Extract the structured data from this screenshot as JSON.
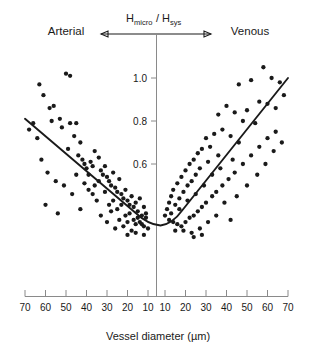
{
  "chart_data": {
    "type": "scatter",
    "title": "",
    "xlabel": "Vessel diameter (µm)",
    "ylabel": "Hmicro/Hsys",
    "ylabel_parts": {
      "h1": "H",
      "sub1": "micro",
      "slash": "/",
      "h2": "H",
      "sub2": "sys"
    },
    "side_labels": {
      "left": "Arterial",
      "right": "Venous"
    },
    "grid": false,
    "legend": "none",
    "xticks_left": [
      70,
      60,
      50,
      40,
      30,
      20,
      10
    ],
    "xticks_right": [
      10,
      20,
      30,
      40,
      50,
      60,
      70
    ],
    "xtick_labels_left": [
      "70",
      "60",
      "50",
      "40",
      "30",
      "20",
      "10"
    ],
    "xtick_labels_right": [
      "10",
      "20",
      "30",
      "40",
      "50",
      "60",
      "70"
    ],
    "yticks": [
      0.6,
      0.8,
      1.0
    ],
    "ytick_labels": [
      "0.6",
      "0.8",
      "1.0"
    ],
    "ylim": [
      0.25,
      1.08
    ],
    "axis_note": "x axis is mirrored: arterial diameters decrease left-to-right toward 10, venous diameters increase from 10 rightward",
    "series": [
      {
        "name": "Arterial vessels",
        "branch": "arterial",
        "marker": "filled-circle",
        "color": "#1a1a1a",
        "points": [
          {
            "d": 63,
            "r": 0.97
          },
          {
            "d": 61,
            "r": 0.92
          },
          {
            "d": 58,
            "r": 0.86
          },
          {
            "d": 56,
            "r": 0.87
          },
          {
            "d": 50,
            "r": 1.02
          },
          {
            "d": 48,
            "r": 1.01
          },
          {
            "d": 57,
            "r": 0.8
          },
          {
            "d": 53,
            "r": 0.81
          },
          {
            "d": 52,
            "r": 0.77
          },
          {
            "d": 48,
            "r": 0.79
          },
          {
            "d": 45,
            "r": 0.79
          },
          {
            "d": 46,
            "r": 0.73
          },
          {
            "d": 43,
            "r": 0.7
          },
          {
            "d": 49,
            "r": 0.67
          },
          {
            "d": 44,
            "r": 0.64
          },
          {
            "d": 42,
            "r": 0.62
          },
          {
            "d": 41,
            "r": 0.6
          },
          {
            "d": 40,
            "r": 0.58
          },
          {
            "d": 38,
            "r": 0.61
          },
          {
            "d": 37,
            "r": 0.59
          },
          {
            "d": 36,
            "r": 0.66
          },
          {
            "d": 34,
            "r": 0.63
          },
          {
            "d": 33,
            "r": 0.57
          },
          {
            "d": 32,
            "r": 0.55
          },
          {
            "d": 30,
            "r": 0.54
          },
          {
            "d": 31,
            "r": 0.59
          },
          {
            "d": 29,
            "r": 0.52
          },
          {
            "d": 28,
            "r": 0.5
          },
          {
            "d": 27,
            "r": 0.56
          },
          {
            "d": 26,
            "r": 0.49
          },
          {
            "d": 25,
            "r": 0.47
          },
          {
            "d": 24,
            "r": 0.53
          },
          {
            "d": 23,
            "r": 0.46
          },
          {
            "d": 22,
            "r": 0.44
          },
          {
            "d": 21,
            "r": 0.48
          },
          {
            "d": 20,
            "r": 0.43
          },
          {
            "d": 19,
            "r": 0.41
          },
          {
            "d": 18,
            "r": 0.45
          },
          {
            "d": 17,
            "r": 0.4
          },
          {
            "d": 16,
            "r": 0.42
          },
          {
            "d": 15,
            "r": 0.38
          },
          {
            "d": 14,
            "r": 0.44
          },
          {
            "d": 13,
            "r": 0.36
          },
          {
            "d": 12,
            "r": 0.4
          },
          {
            "d": 11,
            "r": 0.35
          },
          {
            "d": 66,
            "r": 0.79
          },
          {
            "d": 68,
            "r": 0.76
          },
          {
            "d": 64,
            "r": 0.72
          },
          {
            "d": 62,
            "r": 0.62
          },
          {
            "d": 59,
            "r": 0.56
          },
          {
            "d": 55,
            "r": 0.52
          },
          {
            "d": 51,
            "r": 0.5
          },
          {
            "d": 47,
            "r": 0.46
          },
          {
            "d": 39,
            "r": 0.48
          },
          {
            "d": 35,
            "r": 0.43
          },
          {
            "d": 60,
            "r": 0.41
          },
          {
            "d": 54,
            "r": 0.37
          },
          {
            "d": 43,
            "r": 0.39
          },
          {
            "d": 33,
            "r": 0.36
          },
          {
            "d": 28,
            "r": 0.38
          },
          {
            "d": 24,
            "r": 0.34
          },
          {
            "d": 20,
            "r": 0.33
          },
          {
            "d": 16,
            "r": 0.32
          },
          {
            "d": 12,
            "r": 0.31
          },
          {
            "d": 26,
            "r": 0.3
          },
          {
            "d": 18,
            "r": 0.29
          },
          {
            "d": 14,
            "r": 0.33
          },
          {
            "d": 30,
            "r": 0.33
          },
          {
            "d": 22,
            "r": 0.31
          },
          {
            "d": 36,
            "r": 0.5
          },
          {
            "d": 31,
            "r": 0.47
          },
          {
            "d": 27,
            "r": 0.43
          },
          {
            "d": 23,
            "r": 0.41
          },
          {
            "d": 19,
            "r": 0.37
          },
          {
            "d": 15,
            "r": 0.35
          },
          {
            "d": 11,
            "r": 0.37
          },
          {
            "d": 13,
            "r": 0.32
          },
          {
            "d": 17,
            "r": 0.34
          },
          {
            "d": 21,
            "r": 0.36
          },
          {
            "d": 25,
            "r": 0.39
          },
          {
            "d": 29,
            "r": 0.41
          },
          {
            "d": 39,
            "r": 0.55
          },
          {
            "d": 34,
            "r": 0.52
          },
          {
            "d": 45,
            "r": 0.55
          },
          {
            "d": 41,
            "r": 0.51
          },
          {
            "d": 37,
            "r": 0.46
          },
          {
            "d": 12,
            "r": 0.27
          },
          {
            "d": 16,
            "r": 0.28
          },
          {
            "d": 20,
            "r": 0.27
          },
          {
            "d": 10,
            "r": 0.3
          }
        ]
      },
      {
        "name": "Venous vessels",
        "branch": "venous",
        "marker": "filled-circle",
        "color": "#1a1a1a",
        "points": [
          {
            "d": 58,
            "r": 1.05
          },
          {
            "d": 62,
            "r": 1.0
          },
          {
            "d": 52,
            "r": 0.99
          },
          {
            "d": 66,
            "r": 0.98
          },
          {
            "d": 46,
            "r": 0.97
          },
          {
            "d": 68,
            "r": 0.92
          },
          {
            "d": 56,
            "r": 0.89
          },
          {
            "d": 60,
            "r": 0.88
          },
          {
            "d": 64,
            "r": 0.86
          },
          {
            "d": 50,
            "r": 0.85
          },
          {
            "d": 44,
            "r": 0.84
          },
          {
            "d": 40,
            "r": 0.87
          },
          {
            "d": 36,
            "r": 0.83
          },
          {
            "d": 48,
            "r": 0.8
          },
          {
            "d": 54,
            "r": 0.79
          },
          {
            "d": 38,
            "r": 0.76
          },
          {
            "d": 34,
            "r": 0.74
          },
          {
            "d": 42,
            "r": 0.73
          },
          {
            "d": 30,
            "r": 0.72
          },
          {
            "d": 46,
            "r": 0.7
          },
          {
            "d": 32,
            "r": 0.68
          },
          {
            "d": 28,
            "r": 0.67
          },
          {
            "d": 26,
            "r": 0.65
          },
          {
            "d": 36,
            "r": 0.64
          },
          {
            "d": 24,
            "r": 0.62
          },
          {
            "d": 31,
            "r": 0.61
          },
          {
            "d": 22,
            "r": 0.6
          },
          {
            "d": 27,
            "r": 0.58
          },
          {
            "d": 20,
            "r": 0.57
          },
          {
            "d": 25,
            "r": 0.55
          },
          {
            "d": 18,
            "r": 0.54
          },
          {
            "d": 23,
            "r": 0.52
          },
          {
            "d": 16,
            "r": 0.51
          },
          {
            "d": 21,
            "r": 0.5
          },
          {
            "d": 14,
            "r": 0.48
          },
          {
            "d": 19,
            "r": 0.47
          },
          {
            "d": 13,
            "r": 0.45
          },
          {
            "d": 17,
            "r": 0.44
          },
          {
            "d": 12,
            "r": 0.42
          },
          {
            "d": 15,
            "r": 0.41
          },
          {
            "d": 11,
            "r": 0.39
          },
          {
            "d": 13,
            "r": 0.37
          },
          {
            "d": 10,
            "r": 0.36
          },
          {
            "d": 12,
            "r": 0.34
          },
          {
            "d": 14,
            "r": 0.33
          },
          {
            "d": 16,
            "r": 0.32
          },
          {
            "d": 18,
            "r": 0.31
          },
          {
            "d": 20,
            "r": 0.33
          },
          {
            "d": 22,
            "r": 0.35
          },
          {
            "d": 24,
            "r": 0.36
          },
          {
            "d": 26,
            "r": 0.38
          },
          {
            "d": 28,
            "r": 0.4
          },
          {
            "d": 30,
            "r": 0.42
          },
          {
            "d": 33,
            "r": 0.45
          },
          {
            "d": 35,
            "r": 0.47
          },
          {
            "d": 38,
            "r": 0.5
          },
          {
            "d": 41,
            "r": 0.53
          },
          {
            "d": 44,
            "r": 0.56
          },
          {
            "d": 48,
            "r": 0.6
          },
          {
            "d": 52,
            "r": 0.64
          },
          {
            "d": 56,
            "r": 0.68
          },
          {
            "d": 60,
            "r": 0.72
          },
          {
            "d": 64,
            "r": 0.75
          },
          {
            "d": 19,
            "r": 0.29
          },
          {
            "d": 23,
            "r": 0.28
          },
          {
            "d": 27,
            "r": 0.3
          },
          {
            "d": 15,
            "r": 0.29
          },
          {
            "d": 31,
            "r": 0.33
          },
          {
            "d": 35,
            "r": 0.36
          },
          {
            "d": 29,
            "r": 0.5
          },
          {
            "d": 25,
            "r": 0.46
          },
          {
            "d": 21,
            "r": 0.43
          },
          {
            "d": 17,
            "r": 0.39
          },
          {
            "d": 33,
            "r": 0.55
          },
          {
            "d": 37,
            "r": 0.58
          },
          {
            "d": 43,
            "r": 0.62
          },
          {
            "d": 39,
            "r": 0.42
          },
          {
            "d": 45,
            "r": 0.45
          },
          {
            "d": 50,
            "r": 0.5
          },
          {
            "d": 55,
            "r": 0.55
          },
          {
            "d": 59,
            "r": 0.6
          },
          {
            "d": 63,
            "r": 0.66
          },
          {
            "d": 67,
            "r": 0.7
          },
          {
            "d": 42,
            "r": 0.34
          },
          {
            "d": 24,
            "r": 0.26
          },
          {
            "d": 28,
            "r": 0.27
          }
        ]
      }
    ],
    "fit_curve": {
      "name": "Fitted trend",
      "description": "V-shaped fit: hematocrit ratio falls with decreasing arterial diameter to a minimum near 10 microns, then rises with increasing venous diameter",
      "color": "#1a1a1a",
      "minimum": {
        "d": 11,
        "r": 0.33
      },
      "arterial_endpoint": {
        "d": 70,
        "r": 0.81
      },
      "venous_endpoint": {
        "d": 70,
        "r": 1.0
      }
    }
  }
}
